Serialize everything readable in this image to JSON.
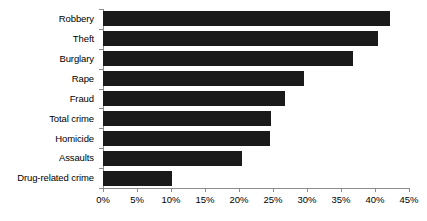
{
  "chart_data": {
    "type": "bar",
    "orientation": "horizontal",
    "title": "",
    "xlabel": "",
    "ylabel": "",
    "categories": [
      "Robbery",
      "Theft",
      "Burglary",
      "Rape",
      "Fraud",
      "Total crime",
      "Homicide",
      "Assaults",
      "Drug-related crime"
    ],
    "values": [
      42.2,
      40.5,
      36.8,
      29.5,
      26.7,
      24.7,
      24.6,
      20.4,
      10.2
    ],
    "value_suffix": "%",
    "xlim": [
      0,
      45
    ],
    "xticks": [
      0,
      5,
      10,
      15,
      20,
      25,
      30,
      35,
      40,
      45
    ],
    "xtick_labels": [
      "0%",
      "5%",
      "10%",
      "15%",
      "20%",
      "25%",
      "30%",
      "35%",
      "40%",
      "45%"
    ],
    "grid": false,
    "legend": null,
    "bar_color": "#1a1a1a",
    "axis_color": "#8c8c8c",
    "background_color": "#ffffff"
  }
}
